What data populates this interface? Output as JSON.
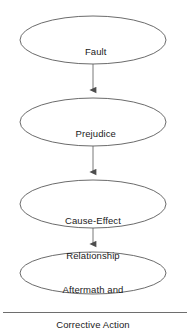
{
  "diagram": {
    "type": "flowchart",
    "orientation": "vertical",
    "background_color": "#ffffff",
    "shape_outline_color": "#5a5a5a",
    "connector_color": "#6a6a6a",
    "text_color": "#1a1a1a",
    "nodes": [
      {
        "id": "fault",
        "shape": "ellipse",
        "label": "Fault",
        "lines": [
          "Fault"
        ],
        "cx": 93,
        "cy": 40,
        "rx": 73,
        "ry": 24
      },
      {
        "id": "prejudice",
        "shape": "ellipse",
        "label": "Prejudice",
        "lines": [
          "Prejudice"
        ],
        "cx": 93,
        "cy": 122,
        "rx": 73,
        "ry": 24
      },
      {
        "id": "cause-effect-relationship",
        "shape": "ellipse",
        "label": "Cause-Effect Relationship",
        "lines": [
          "Cause-Effect",
          "Relationship"
        ],
        "cx": 93,
        "cy": 204,
        "rx": 73,
        "ry": 24
      },
      {
        "id": "aftermath-and-corrective-action",
        "shape": "ellipse",
        "label": "Aftermath and Corrective Action",
        "lines": [
          "Aftermath and",
          "Corrective Action"
        ],
        "cx": 93,
        "cy": 273,
        "rx": 73,
        "ry": 21
      }
    ],
    "connectors": [
      {
        "id": "fault-to-prejudice",
        "from": "fault",
        "to": "prejudice",
        "arrowhead": "solid-triangle",
        "direction": "down"
      },
      {
        "id": "prejudice-to-cause-effect",
        "from": "prejudice",
        "to": "cause-effect-relationship",
        "arrowhead": "solid-triangle",
        "direction": "down"
      },
      {
        "id": "cause-effect-to-aftermath",
        "from": "cause-effect-relationship",
        "to": "aftermath-and-corrective-action",
        "arrowhead": "solid-triangle",
        "direction": "down"
      }
    ],
    "footer_rule": {
      "color": "#6e6e6e"
    }
  },
  "labels": {
    "node1_line1": "Fault",
    "node2_line1": "Prejudice",
    "node3_line1": "Cause-Effect",
    "node3_line2": "Relationship",
    "node4_line1": "Aftermath and",
    "node4_line2": "Corrective Action"
  }
}
